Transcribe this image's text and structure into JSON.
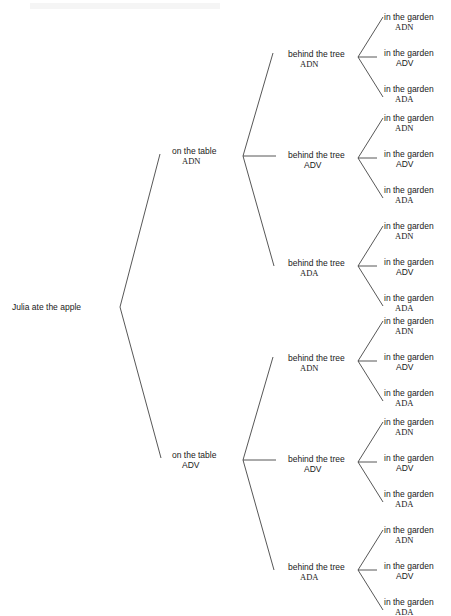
{
  "diagram": {
    "type": "tree",
    "orientation": "left-to-right",
    "line_color": "#444444",
    "root": {
      "label": "Julia ate the apple"
    },
    "level1": [
      {
        "label": "on the table",
        "tag": "ADN"
      },
      {
        "label": "on the table",
        "tag": "ADV"
      }
    ],
    "level2": [
      {
        "label": "behind the tree",
        "tag": "ADN"
      },
      {
        "label": "behind the tree",
        "tag": "ADV"
      },
      {
        "label": "behind the tree",
        "tag": "ADA"
      },
      {
        "label": "behind the tree",
        "tag": "ADN"
      },
      {
        "label": "behind the tree",
        "tag": "ADV"
      },
      {
        "label": "behind the tree",
        "tag": "ADA"
      }
    ],
    "level3_label": "in the garden",
    "level3_tags": [
      "ADN",
      "ADV",
      "ADA"
    ],
    "leaves": [
      {
        "label": "in the garden",
        "tag": "ADN"
      },
      {
        "label": "in the garden",
        "tag": "ADV"
      },
      {
        "label": "in the garden",
        "tag": "ADA"
      },
      {
        "label": "in the garden",
        "tag": "ADN"
      },
      {
        "label": "in the garden",
        "tag": "ADV"
      },
      {
        "label": "in the garden",
        "tag": "ADA"
      },
      {
        "label": "in the garden",
        "tag": "ADN"
      },
      {
        "label": "in the garden",
        "tag": "ADV"
      },
      {
        "label": "in the garden",
        "tag": "ADA"
      },
      {
        "label": "in the garden",
        "tag": "ADN"
      },
      {
        "label": "in the garden",
        "tag": "ADV"
      },
      {
        "label": "in the garden",
        "tag": "ADA"
      },
      {
        "label": "in the garden",
        "tag": "ADN"
      },
      {
        "label": "in the garden",
        "tag": "ADV"
      },
      {
        "label": "in the garden",
        "tag": "ADA"
      },
      {
        "label": "in the garden",
        "tag": "ADN"
      },
      {
        "label": "in the garden",
        "tag": "ADV"
      },
      {
        "label": "in the garden",
        "tag": "ADA"
      }
    ]
  }
}
